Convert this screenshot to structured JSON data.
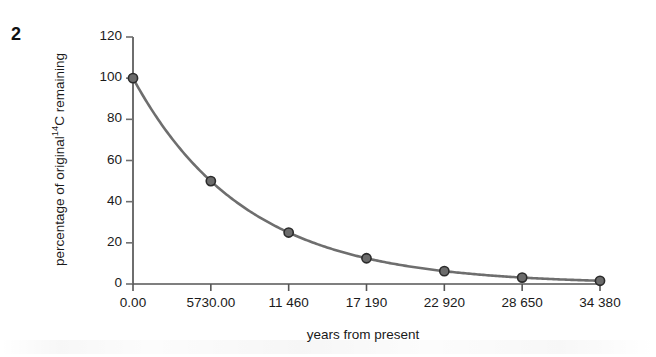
{
  "figure": {
    "number": "2"
  },
  "chart_data": {
    "type": "line",
    "title": "",
    "xlabel": "years from present",
    "ylabel": "percentage of original 14C remaining",
    "ylabel_prefix": "percentage of original",
    "ylabel_superscript": "14",
    "ylabel_suffix": "C remaining",
    "x": [
      0,
      5730,
      11460,
      17190,
      22920,
      28650,
      34380
    ],
    "values": [
      100,
      50,
      25,
      12.5,
      6.25,
      3.125,
      1.5625
    ],
    "x_tick_labels": [
      "0.00",
      "5730.00",
      "11 460",
      "17 190",
      "22 920",
      "28 650",
      "34 380"
    ],
    "y_tick_labels": [
      "0",
      "20",
      "40",
      "60",
      "80",
      "100",
      "120"
    ],
    "y_ticks": [
      0,
      20,
      40,
      60,
      80,
      100,
      120
    ],
    "xlim": [
      0,
      34380
    ],
    "ylim": [
      0,
      120
    ],
    "grid": false,
    "legend": "none",
    "line_color": "#6e6e6e",
    "marker_fill": "#6b6b6b",
    "marker_edge": "#2b2b2b",
    "axis_color": "#6e6e6e"
  }
}
